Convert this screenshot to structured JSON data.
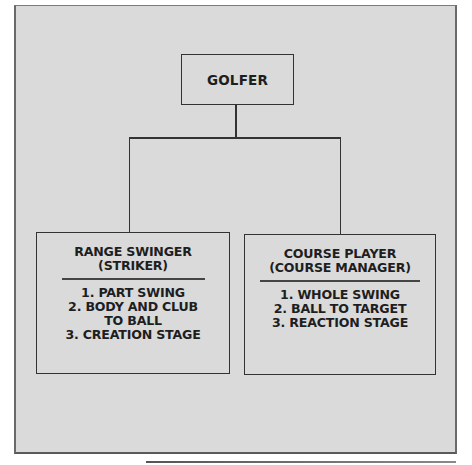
{
  "diagram": {
    "type": "hierarchy",
    "colors": {
      "background": "#dadada",
      "line": "#333333",
      "text": "#1e1e1e"
    },
    "root": {
      "label": "GOLFER"
    },
    "children": [
      {
        "title_lines": [
          "RANGE SWINGER",
          "(STRIKER)"
        ],
        "items": [
          "1. PART SWING",
          "2. BODY AND CLUB",
          "TO BALL",
          "3. CREATION STAGE"
        ]
      },
      {
        "title_lines": [
          "COURSE PLAYER",
          "(COURSE MANAGER)"
        ],
        "items": [
          "1. WHOLE SWING",
          "2. BALL TO TARGET",
          "3. REACTION STAGE"
        ]
      }
    ]
  }
}
